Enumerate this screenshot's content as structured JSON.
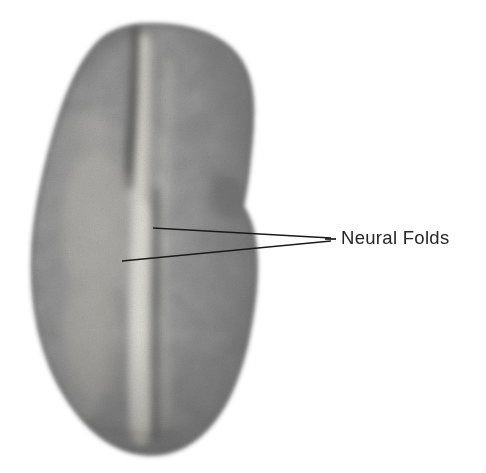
{
  "figure": {
    "background_color": "#ffffff"
  },
  "labels": {
    "top": {
      "text": "Anterior",
      "color": "#3a3a3a",
      "cropped": "true"
    },
    "right": {
      "text": "Neural Folds",
      "color": "#262626"
    }
  },
  "annotation": {
    "leader_line_color": "#1a1a1a",
    "converge_point": {
      "x": 331,
      "y": 239
    },
    "lines": [
      {
        "from_x": 153,
        "from_y": 228,
        "to_x": 331,
        "to_y": 238
      },
      {
        "from_x": 122,
        "from_y": 261,
        "to_x": 331,
        "to_y": 241
      }
    ]
  },
  "specimen": {
    "outline_color": "#9a9a9a",
    "body_dark": "#6f6f6f",
    "body_mid": "#8b8b8b",
    "body_light": "#b9b9b9",
    "fold_highlight": "#d8d6cf",
    "groove_dark": "#4d4d4d",
    "bounds": {
      "left": 31,
      "top": 23,
      "right": 256,
      "bottom": 456
    }
  }
}
